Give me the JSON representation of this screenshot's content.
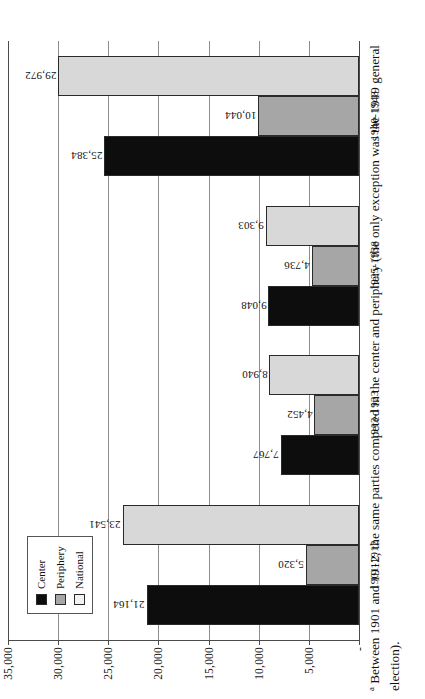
{
  "chart_data": {
    "type": "bar",
    "orientation": "horizontal-rotated",
    "title": "",
    "xlabel": "",
    "ylabel": "",
    "ylim": [
      0,
      35000
    ],
    "grid": true,
    "legend_position": "upper-left-inside",
    "categories": [
      "1901-1912",
      "1913-1923",
      "1925-1938",
      "1940-1948"
    ],
    "tick_labels": [
      "35,000",
      "30,000",
      "25,000",
      "20,000",
      "15,000",
      "10,000",
      "5,000",
      "-"
    ],
    "tick_values": [
      35000,
      30000,
      25000,
      20000,
      15000,
      10000,
      5000,
      0
    ],
    "series": [
      {
        "name": "Center",
        "color": "#0d0d0d",
        "values": [
          21164,
          7767,
          9048,
          25384
        ],
        "labels": [
          "21,164",
          "7,767",
          "9,048",
          "25,384"
        ]
      },
      {
        "name": "Periphery",
        "color": "#a6a6a6",
        "values": [
          5320,
          4452,
          4736,
          10044
        ],
        "labels": [
          "5,320",
          "4,452",
          "4,736",
          "10,044"
        ]
      },
      {
        "name": "National",
        "color": "#d8d8d8",
        "values": [
          23541,
          8940,
          9303,
          29972
        ],
        "labels": [
          "23,541",
          "8,940",
          "9,303",
          "29,972"
        ]
      }
    ]
  },
  "legend": {
    "items": [
      {
        "label": "Center",
        "swatch": "center"
      },
      {
        "label": "Periphery",
        "swatch": "periphery"
      },
      {
        "label": "National",
        "swatch": "national"
      }
    ]
  },
  "footnote": {
    "marker": "a",
    "text": " Between 1901 and 1912, the same parties competed in the center and periphery (the only exception was the 1919 general election)."
  }
}
